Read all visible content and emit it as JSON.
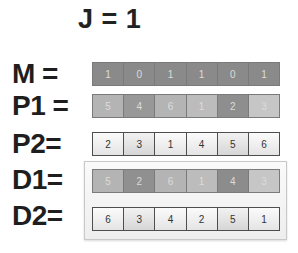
{
  "title": "J = 1",
  "rows": {
    "M": {
      "label": "M =",
      "values": [
        "1",
        "0",
        "1",
        "1",
        "0",
        "1"
      ],
      "colors": [
        "#8a8a8a",
        "#8a8a8a",
        "#8a8a8a",
        "#8a8a8a",
        "#8a8a8a",
        "#8a8a8a"
      ]
    },
    "P1": {
      "label": "P1 =",
      "values": [
        "5",
        "4",
        "6",
        "1",
        "2",
        "3"
      ],
      "colors": [
        "#b4b4b4",
        "#989898",
        "#b4b4b4",
        "#bcbcbc",
        "#8e8e8e",
        "#c6c6c6"
      ]
    },
    "P2": {
      "label": "P2=",
      "values": [
        "2",
        "3",
        "1",
        "4",
        "5",
        "6"
      ]
    },
    "D1": {
      "label": "D1=",
      "values": [
        "5",
        "2",
        "6",
        "1",
        "4",
        "3"
      ],
      "colors": [
        "#b4b4b4",
        "#909090",
        "#b4b4b4",
        "#bcbcbc",
        "#8c8c8c",
        "#c6c6c6"
      ]
    },
    "D2": {
      "label": "D2=",
      "values": [
        "6",
        "3",
        "4",
        "2",
        "5",
        "1"
      ]
    }
  }
}
